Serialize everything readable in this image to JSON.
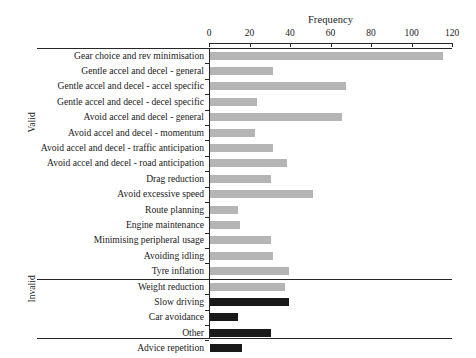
{
  "chart_data": {
    "type": "bar",
    "orientation": "horizontal",
    "title": "",
    "xlabel": "Frequency",
    "ylabel": "",
    "xlim": [
      0,
      120
    ],
    "xticks": [
      0,
      20,
      40,
      60,
      80,
      100,
      120
    ],
    "grid": false,
    "legend": "none",
    "colors": {
      "valid_bar": "#b5b5b5",
      "invalid_bar": "#191919",
      "axis": "#262626",
      "text": "#1a1a1a",
      "background": "#ffffff"
    },
    "groups": [
      {
        "name": "Valid",
        "categories": [
          "Gear choice and rev minimisation",
          "Gentle accel and decel - general",
          "Gentle accel and decel - accel specific",
          "Gentle accel and decel - decel specific",
          "Avoid accel and decel - general",
          "Avoid accel and decel - momentum",
          "Avoid accel and decel - traffic anticipation",
          "Avoid accel and decel - road anticipation",
          "Drag reduction",
          "Avoid excessive speed",
          "Route planning",
          "Engine maintenance",
          "Minimising peripheral usage",
          "Avoiding idling",
          "Tyre inflation",
          "Weight reduction"
        ],
        "values": [
          115,
          31,
          67,
          23,
          65,
          22,
          31,
          38,
          30,
          51,
          14,
          15,
          30,
          31,
          39,
          37
        ]
      },
      {
        "name": "Invalid",
        "categories": [
          "Slow driving",
          "Car avoidance",
          "Other",
          "Advice repetition"
        ],
        "values": [
          39,
          14,
          30,
          16
        ]
      }
    ]
  }
}
